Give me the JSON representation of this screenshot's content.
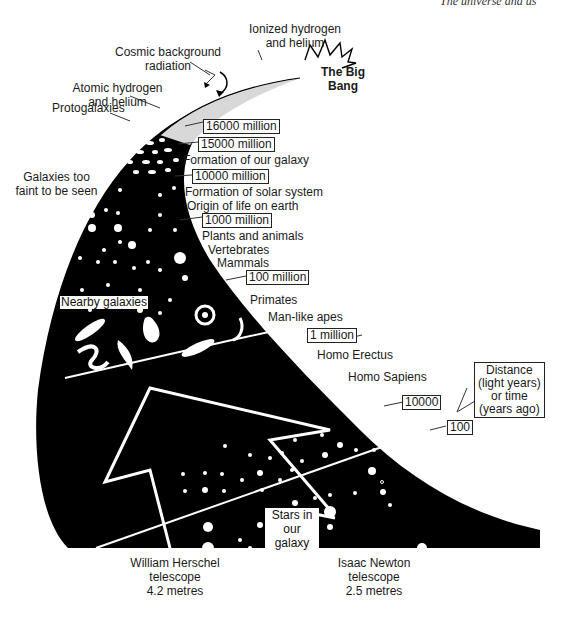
{
  "header": {
    "running_title": "The universe and us"
  },
  "diagram": {
    "title": "The Big Bang",
    "early_universe_labels": [
      "Ionized hydrogen and helium",
      "Cosmic background radiation",
      "Atomic hydrogen and helium",
      "Protogalaxies"
    ],
    "region_labels": {
      "faint_galaxies": "Galaxies too faint to be seen",
      "nearby_galaxies": "Nearby galaxies",
      "stars": "Stars in our galaxy"
    },
    "scale_markers": [
      {
        "value": "16000 million"
      },
      {
        "value": "15000 million"
      },
      {
        "value": "10000 million"
      },
      {
        "value": "1000 million"
      },
      {
        "value": "100 million"
      },
      {
        "value": "1 million"
      },
      {
        "value": "10000"
      },
      {
        "value": "100"
      }
    ],
    "events": [
      "Formation of our galaxy",
      "Formation of solar system",
      "Origin of life on earth",
      "Plants and animals",
      "Vertebrates",
      "Mammals",
      "Primates",
      "Man-like apes",
      "Homo Erectus",
      "Homo Sapiens"
    ],
    "legend_box": {
      "line1": "Distance",
      "line2": "(light years)",
      "line3": "or time",
      "line4": "(years ago)"
    },
    "telescopes": [
      {
        "name": "William Herschel",
        "line2": "telescope",
        "size": "4.2 metres"
      },
      {
        "name": "Isaac Newton",
        "line2": "telescope",
        "size": "2.5 metres"
      }
    ]
  }
}
